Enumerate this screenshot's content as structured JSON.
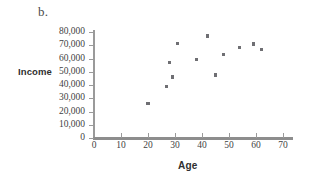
{
  "figure": {
    "label": "b."
  },
  "chart_data": {
    "type": "scatter",
    "title": "",
    "xlabel": "Age",
    "ylabel": "Income",
    "xlim": [
      0,
      74
    ],
    "ylim": [
      0,
      84000
    ],
    "grid": false,
    "legend": null,
    "x_ticks": [
      0,
      10,
      20,
      30,
      40,
      50,
      60,
      70
    ],
    "x_tick_labels": [
      "0",
      "10",
      "20",
      "30",
      "40",
      "50",
      "60",
      "70"
    ],
    "y_ticks": [
      0,
      10000,
      20000,
      30000,
      40000,
      50000,
      60000,
      70000,
      80000
    ],
    "y_tick_labels": [
      "0",
      "10,000",
      "20,000",
      "30,000",
      "40,000",
      "50,000",
      "60,000",
      "70,000",
      "80,000"
    ],
    "marker_color": "#6f6f73",
    "axis_color": "#9a9a9a",
    "points": [
      {
        "x": 20,
        "y": 26000
      },
      {
        "x": 27,
        "y": 39000
      },
      {
        "x": 28,
        "y": 57000
      },
      {
        "x": 29,
        "y": 46000
      },
      {
        "x": 31,
        "y": 71500
      },
      {
        "x": 38,
        "y": 59000
      },
      {
        "x": 42,
        "y": 77000
      },
      {
        "x": 45,
        "y": 47500
      },
      {
        "x": 48,
        "y": 63000
      },
      {
        "x": 54,
        "y": 68500
      },
      {
        "x": 59,
        "y": 71000
      },
      {
        "x": 62,
        "y": 67000
      }
    ]
  }
}
